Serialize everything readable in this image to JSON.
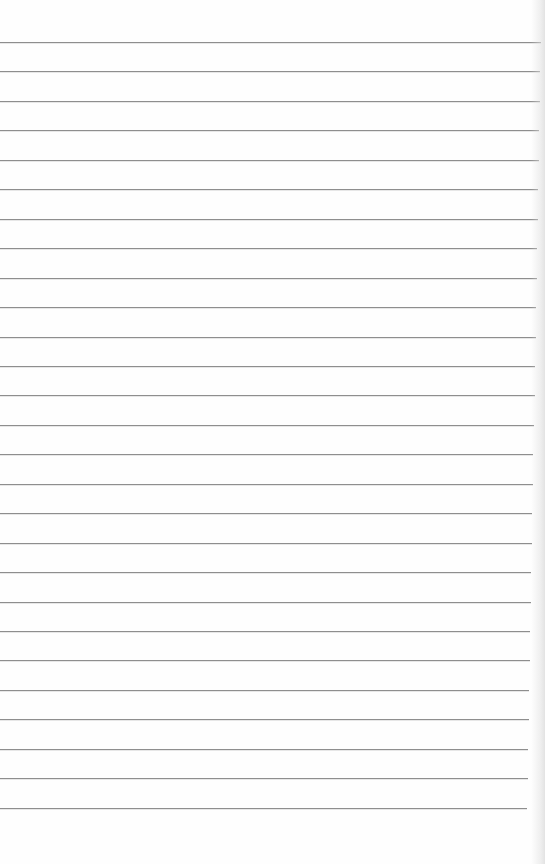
{
  "document": {
    "type": "lined-paper",
    "background_color": "#fefefe",
    "rule_color": "#8e8e8e",
    "rule_count": 27,
    "first_rule_y": 42,
    "rule_spacing": 29.45,
    "rule_right_edge_top": 541,
    "rule_right_edge_bottom": 527,
    "text": ""
  }
}
